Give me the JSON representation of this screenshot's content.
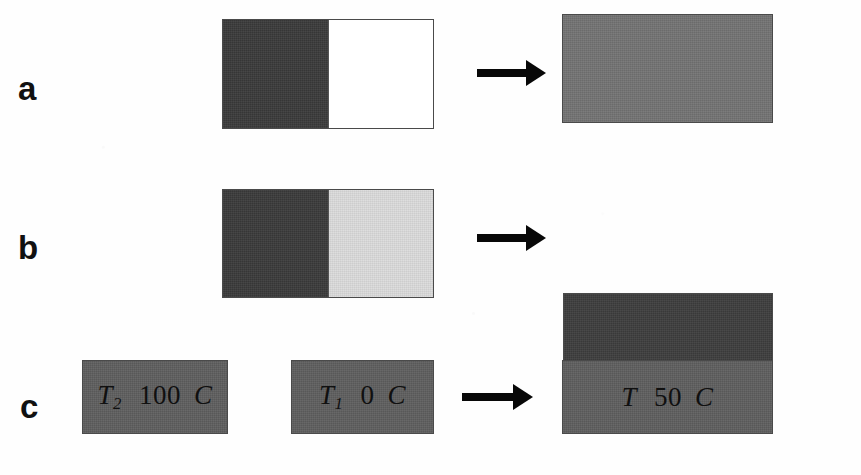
{
  "figure": {
    "background": "#ffffff",
    "width": 861,
    "height": 475
  },
  "colors": {
    "dark": "#3a3a3a",
    "dark_alt": "#3d3d3d",
    "medium": "#737373",
    "block_gray": "#5e5e5e",
    "light": "#dcdcdc",
    "white": "#ffffff",
    "outline": "#4a4a4a",
    "arrow": "#080808",
    "text": "#101010",
    "label": "#111111"
  },
  "panels": [
    {
      "id": "a",
      "label": "a",
      "before": {
        "name": "split-box-a",
        "left_fill": "dark",
        "right_fill": "white"
      },
      "arrow": {
        "name": "arrow-a",
        "direction": "right"
      },
      "after": {
        "name": "result-box-a",
        "fill": "medium"
      }
    },
    {
      "id": "b",
      "label": "b",
      "before": {
        "name": "split-box-b",
        "left_fill": "dark",
        "right_fill": "light"
      },
      "arrow": {
        "name": "arrow-b",
        "direction": "right"
      },
      "after": {
        "name": "result-box-b",
        "fill": "dark_alt"
      }
    },
    {
      "id": "c",
      "label": "c",
      "before_left": {
        "name": "temperature-box-hot",
        "symbol": "T",
        "subscript": "2",
        "value": "100",
        "unit": "C",
        "fill": "block_gray"
      },
      "before_right": {
        "name": "temperature-box-cold",
        "symbol": "T",
        "subscript": "1",
        "value": "0",
        "unit": "C",
        "fill": "block_gray"
      },
      "arrow": {
        "name": "arrow-c",
        "direction": "right"
      },
      "after": {
        "name": "temperature-box-equilibrium",
        "symbol": "T",
        "subscript": "",
        "value": "50",
        "unit": "C",
        "fill": "block_gray"
      }
    }
  ]
}
